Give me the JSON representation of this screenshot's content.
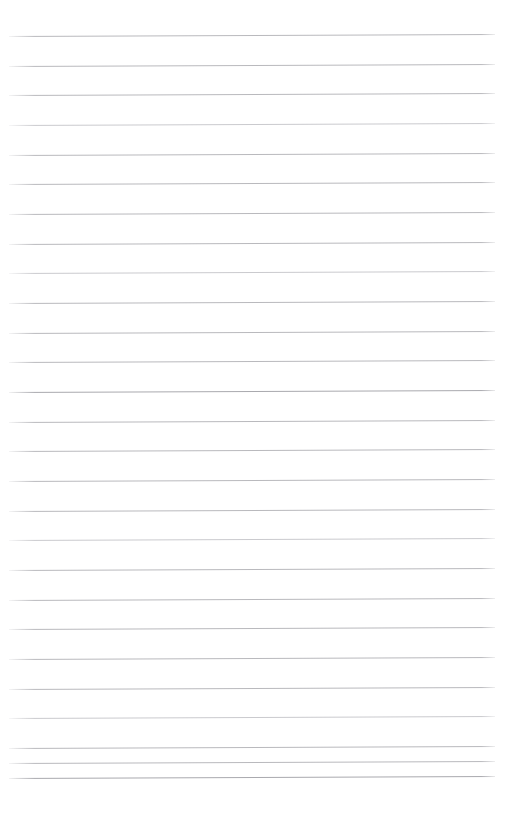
{
  "document": {
    "kind": "ruled-paper",
    "title": "Blank ruled paper",
    "page_width": 520,
    "page_height": 820,
    "background_color": "#ffffff",
    "is_blank": true,
    "written_text": ""
  },
  "ruling": {
    "line_color": "#b9b9bd",
    "line_color_dense": "#a9a9ae",
    "line_color_faint": "#cacace",
    "line_thickness": 1,
    "line_count": 27,
    "first_line_y": 36,
    "last_line_y": 778,
    "line_spacing": 29.6,
    "left_margin_x": 9,
    "right_margin_x": 495,
    "line_length": 486,
    "skew_degrees": -0.24,
    "margin_rule": "none",
    "header_space_height": 36,
    "footer_space_height": 42
  },
  "lines": [
    {
      "index": 1,
      "y": 36,
      "x": 9,
      "width": 486,
      "shade": "normal"
    },
    {
      "index": 2,
      "y": 66,
      "x": 9,
      "width": 486,
      "shade": "normal"
    },
    {
      "index": 3,
      "y": 95,
      "x": 9,
      "width": 486,
      "shade": "normal"
    },
    {
      "index": 4,
      "y": 125,
      "x": 9,
      "width": 486,
      "shade": "faint"
    },
    {
      "index": 5,
      "y": 155,
      "x": 9,
      "width": 486,
      "shade": "normal"
    },
    {
      "index": 6,
      "y": 184,
      "x": 9,
      "width": 486,
      "shade": "normal"
    },
    {
      "index": 7,
      "y": 214,
      "x": 9,
      "width": 486,
      "shade": "normal"
    },
    {
      "index": 8,
      "y": 244,
      "x": 9,
      "width": 486,
      "shade": "normal"
    },
    {
      "index": 9,
      "y": 273,
      "x": 9,
      "width": 486,
      "shade": "faint"
    },
    {
      "index": 10,
      "y": 303,
      "x": 9,
      "width": 486,
      "shade": "normal"
    },
    {
      "index": 11,
      "y": 333,
      "x": 9,
      "width": 486,
      "shade": "normal"
    },
    {
      "index": 12,
      "y": 362,
      "x": 9,
      "width": 486,
      "shade": "normal"
    },
    {
      "index": 13,
      "y": 392,
      "x": 9,
      "width": 486,
      "shade": "dense"
    },
    {
      "index": 14,
      "y": 422,
      "x": 9,
      "width": 486,
      "shade": "normal"
    },
    {
      "index": 15,
      "y": 451,
      "x": 9,
      "width": 486,
      "shade": "normal"
    },
    {
      "index": 16,
      "y": 481,
      "x": 9,
      "width": 486,
      "shade": "normal"
    },
    {
      "index": 17,
      "y": 511,
      "x": 9,
      "width": 486,
      "shade": "normal"
    },
    {
      "index": 18,
      "y": 540,
      "x": 9,
      "width": 486,
      "shade": "faint"
    },
    {
      "index": 19,
      "y": 570,
      "x": 9,
      "width": 486,
      "shade": "normal"
    },
    {
      "index": 20,
      "y": 600,
      "x": 9,
      "width": 486,
      "shade": "normal"
    },
    {
      "index": 21,
      "y": 629,
      "x": 9,
      "width": 486,
      "shade": "normal"
    },
    {
      "index": 22,
      "y": 659,
      "x": 9,
      "width": 486,
      "shade": "normal"
    },
    {
      "index": 23,
      "y": 689,
      "x": 9,
      "width": 486,
      "shade": "normal"
    },
    {
      "index": 24,
      "y": 718,
      "x": 9,
      "width": 486,
      "shade": "faint"
    },
    {
      "index": 25,
      "y": 748,
      "x": 9,
      "width": 486,
      "shade": "normal"
    },
    {
      "index": 26,
      "y": 763,
      "x": 9,
      "width": 486,
      "shade": "normal"
    },
    {
      "index": 27,
      "y": 778,
      "x": 9,
      "width": 486,
      "shade": "dense"
    }
  ]
}
